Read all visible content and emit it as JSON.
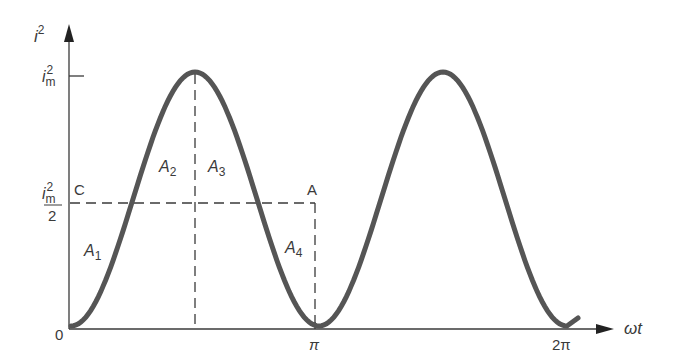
{
  "diagram": {
    "title": "",
    "axes": {
      "y_label": "i",
      "y_label_sup": "2",
      "x_label": "ωt",
      "origin_label": "0"
    },
    "y_ticks": {
      "max": {
        "base": "i",
        "sub": "m",
        "sup": "2"
      },
      "half": {
        "base": "i",
        "sub": "m",
        "sup": "2",
        "denominator": "2"
      }
    },
    "x_ticks": [
      "π",
      "2π"
    ],
    "points": {
      "C": "C",
      "A": "A"
    },
    "areas": [
      {
        "base": "A",
        "sub": "1"
      },
      {
        "base": "A",
        "sub": "2"
      },
      {
        "base": "A",
        "sub": "3"
      },
      {
        "base": "A",
        "sub": "4"
      }
    ],
    "colors": {
      "curve": "#555555",
      "axes": "#3a3a3a",
      "dashes": "#3a3a3a",
      "background": "#ffffff"
    }
  },
  "chart_data": {
    "type": "line",
    "title": "",
    "xlabel": "ωt",
    "ylabel": "i²",
    "x_ticks": [
      "0",
      "π",
      "2π"
    ],
    "y_ticks": [
      "0",
      "i_m²/2",
      "i_m²"
    ],
    "series": [
      {
        "name": "i² = i_m² sin²(ωt)",
        "x": [
          0,
          0.785,
          1.571,
          2.356,
          3.142,
          3.927,
          4.712,
          5.498,
          6.283
        ],
        "values": [
          0,
          0.5,
          1,
          0.5,
          0,
          0.5,
          1,
          0.5,
          0
        ]
      }
    ],
    "annotations": [
      "A1",
      "A2",
      "A3",
      "A4",
      "C",
      "A",
      "mean level i_m²/2"
    ],
    "ylim": [
      0,
      1
    ],
    "grid": false
  }
}
